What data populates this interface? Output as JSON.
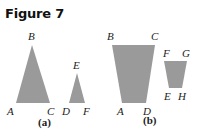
{
  "title": "Figure 7",
  "colors": {
    "fill": "#9a9a9a",
    "text": "#222222"
  },
  "panels": [
    {
      "caption": "(a)",
      "shapes": [
        {
          "name": "triangle-abc",
          "vertices": {
            "A": [
              16,
              103
            ],
            "B": [
              32,
              45
            ],
            "C": [
              50,
              103
            ]
          },
          "labels": {
            "A": "A",
            "B": "B",
            "C": "C"
          }
        },
        {
          "name": "triangle-def",
          "vertices": {
            "D": [
              69,
              103
            ],
            "E": [
              77,
              73
            ],
            "F": [
              85,
              103
            ]
          },
          "labels": {
            "D": "D",
            "E": "E",
            "F": "F"
          }
        }
      ]
    },
    {
      "caption": "(b)",
      "shapes": [
        {
          "name": "quadrilateral-abcd",
          "vertices": {
            "B": [
              112,
              45
            ],
            "C": [
              155,
              45
            ],
            "D": [
              146,
              103
            ],
            "A": [
              122,
              103
            ]
          },
          "labels": {
            "A": "A",
            "B": "B",
            "C": "C",
            "D": "D"
          }
        },
        {
          "name": "quadrilateral-fgeh",
          "vertices": {
            "F": [
              164,
              61
            ],
            "G": [
              187,
              61
            ],
            "H": [
              182,
              88
            ],
            "E": [
              169,
              88
            ]
          },
          "labels": {
            "E": "E",
            "F": "F",
            "G": "G",
            "H": "H"
          }
        }
      ]
    }
  ]
}
